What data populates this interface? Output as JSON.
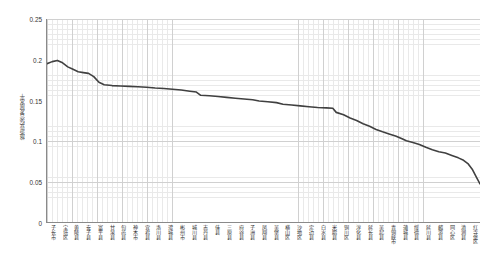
{
  "chart_data": {
    "type": "line",
    "title": "",
    "xlabel": "",
    "ylabel": "旅游业综合发展水平",
    "ylim": [
      0,
      0.25
    ],
    "y_ticks": [
      "0",
      "0.05",
      "0.1",
      "0.15",
      "0.2",
      "0.25"
    ],
    "y_tick_values": [
      0,
      0.05,
      0.1,
      0.15,
      0.2,
      0.25
    ],
    "grid": true,
    "legend": "none",
    "line_color": "#404040",
    "categories": [
      "子长市",
      "宝塔区",
      "黄陵县",
      "安子县",
      "富平县",
      "甘泉县",
      "旬邑县",
      "神木市",
      "宜君县",
      "洛川县",
      "澄城县",
      "彬州市",
      "城川县",
      "志丹县",
      "佳县",
      "三原县",
      "府谷县",
      "子洲县",
      "凤翔县",
      "吴堡县",
      "横山区",
      "沙地区",
      "定边县",
      "白水县",
      "米脂县",
      "铜川区",
      "淳化县",
      "延长县",
      "吴起县",
      "青铜峡市",
      "蒲城县",
      "绥德县",
      "延川县",
      "麟游县",
      "同心区",
      "清涧县",
      "红寺堡区"
    ],
    "values": [
      0.195,
      0.199,
      0.196,
      0.19,
      0.184,
      0.182,
      0.181,
      0.168,
      0.167,
      0.166,
      0.166,
      0.165,
      0.164,
      0.164,
      0.163,
      0.162,
      0.158,
      0.157,
      0.156,
      0.155,
      0.154,
      0.153,
      0.151,
      0.15,
      0.147,
      0.146,
      0.145,
      0.144,
      0.143,
      0.142,
      0.141,
      0.138,
      0.137,
      0.135,
      0.134,
      0.133,
      0.132
    ],
    "points": [
      [
        0.0,
        0.195
      ],
      [
        0.012,
        0.1975
      ],
      [
        0.024,
        0.199
      ],
      [
        0.036,
        0.196
      ],
      [
        0.048,
        0.191
      ],
      [
        0.06,
        0.188
      ],
      [
        0.072,
        0.185
      ],
      [
        0.084,
        0.184
      ],
      [
        0.096,
        0.183
      ],
      [
        0.108,
        0.179
      ],
      [
        0.12,
        0.172
      ],
      [
        0.132,
        0.169
      ],
      [
        0.15,
        0.168
      ],
      [
        0.17,
        0.1675
      ],
      [
        0.19,
        0.167
      ],
      [
        0.21,
        0.1665
      ],
      [
        0.23,
        0.166
      ],
      [
        0.25,
        0.165
      ],
      [
        0.27,
        0.1645
      ],
      [
        0.29,
        0.1635
      ],
      [
        0.31,
        0.1625
      ],
      [
        0.33,
        0.161
      ],
      [
        0.345,
        0.16
      ],
      [
        0.355,
        0.156
      ],
      [
        0.375,
        0.1555
      ],
      [
        0.395,
        0.1545
      ],
      [
        0.415,
        0.1535
      ],
      [
        0.435,
        0.1525
      ],
      [
        0.455,
        0.1515
      ],
      [
        0.475,
        0.1505
      ],
      [
        0.49,
        0.149
      ],
      [
        0.51,
        0.148
      ],
      [
        0.53,
        0.147
      ],
      [
        0.545,
        0.145
      ],
      [
        0.565,
        0.144
      ],
      [
        0.585,
        0.143
      ],
      [
        0.605,
        0.142
      ],
      [
        0.625,
        0.141
      ],
      [
        0.645,
        0.1405
      ],
      [
        0.66,
        0.14
      ],
      [
        0.668,
        0.135
      ],
      [
        0.685,
        0.132
      ],
      [
        0.7,
        0.128
      ],
      [
        0.715,
        0.125
      ],
      [
        0.73,
        0.121
      ],
      [
        0.745,
        0.118
      ],
      [
        0.76,
        0.114
      ],
      [
        0.775,
        0.111
      ],
      [
        0.79,
        0.1085
      ],
      [
        0.805,
        0.106
      ],
      [
        0.82,
        0.1025
      ],
      [
        0.83,
        0.1
      ],
      [
        0.845,
        0.098
      ],
      [
        0.86,
        0.0955
      ],
      [
        0.875,
        0.092
      ],
      [
        0.89,
        0.089
      ],
      [
        0.905,
        0.0865
      ],
      [
        0.92,
        0.085
      ],
      [
        0.935,
        0.082
      ],
      [
        0.95,
        0.079
      ],
      [
        0.962,
        0.076
      ],
      [
        0.972,
        0.072
      ],
      [
        0.982,
        0.065
      ],
      [
        0.991,
        0.056
      ],
      [
        1.0,
        0.047
      ]
    ]
  }
}
